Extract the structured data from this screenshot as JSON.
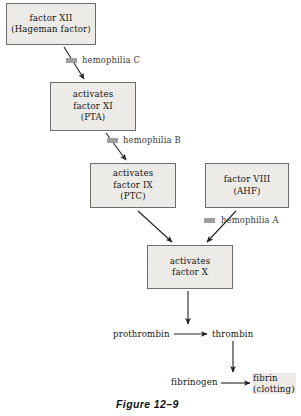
{
  "figure": {
    "caption": "Figure 12–9",
    "topic": "blood coagulation cascade"
  },
  "boxes": [
    {
      "id": "factor-xii",
      "lines": [
        "factor XII",
        "(Hageman factor)"
      ],
      "x": 6,
      "y": 3,
      "w": 90,
      "h": 42
    },
    {
      "id": "factor-xi",
      "lines": [
        "activates",
        "factor XI",
        "(PTA)"
      ],
      "x": 50,
      "y": 82,
      "w": 86,
      "h": 49
    },
    {
      "id": "factor-ix",
      "lines": [
        "activates",
        "factor IX",
        "(PTC)"
      ],
      "x": 90,
      "y": 163,
      "w": 86,
      "h": 45
    },
    {
      "id": "factor-viii",
      "lines": [
        "factor VIII",
        "(AHF)"
      ],
      "x": 205,
      "y": 163,
      "w": 84,
      "h": 45
    },
    {
      "id": "factor-x",
      "lines": [
        "activates",
        "factor X"
      ],
      "x": 147,
      "y": 245,
      "w": 86,
      "h": 44
    }
  ],
  "hemophilia_markers": [
    {
      "id": "hemophilia-c",
      "label": "hemophilia C",
      "mark_x": 66,
      "mark_y": 58,
      "label_x": 82,
      "label_y": 55
    },
    {
      "id": "hemophilia-b",
      "label": "hemophilia B",
      "mark_x": 107,
      "mark_y": 138,
      "label_x": 123,
      "label_y": 135
    },
    {
      "id": "hemophilia-a",
      "label": "hemophilia A",
      "mark_x": 204,
      "mark_y": 218,
      "label_x": 221,
      "label_y": 215
    }
  ],
  "terms": [
    {
      "id": "prothrombin",
      "label": "prothrombin",
      "x": 113,
      "y": 329,
      "shaded": false
    },
    {
      "id": "thrombin",
      "label": "thrombin",
      "x": 212,
      "y": 329,
      "shaded": false
    },
    {
      "id": "fibrinogen",
      "label": "fibrinogen",
      "x": 171,
      "y": 377,
      "shaded": false
    }
  ],
  "fibrin": {
    "id": "fibrin",
    "lines": [
      "fibrin",
      "(clotting)"
    ],
    "x": 252,
    "y": 373
  },
  "colors": {
    "box_fill": "#ecebe7",
    "box_border": "#6d6d6d",
    "marker_gray": "#9f9f9f",
    "text": "#141414",
    "arrow": "#222222",
    "background": "#ffffff"
  },
  "arrows": [
    {
      "id": "arrow-xii-to-xi",
      "type": "diagonal",
      "from": [
        64,
        47
      ],
      "to": [
        84,
        79
      ]
    },
    {
      "id": "arrow-xi-to-ix",
      "type": "diagonal",
      "from": [
        106,
        133
      ],
      "to": [
        126,
        160
      ]
    },
    {
      "id": "arrow-ix-to-x",
      "type": "diagonal",
      "from": [
        138,
        211
      ],
      "to": [
        172,
        242
      ]
    },
    {
      "id": "arrow-viii-to-x",
      "type": "diagonal",
      "from": [
        236,
        211
      ],
      "to": [
        207,
        242
      ]
    },
    {
      "id": "arrow-x-to-prothrombin",
      "type": "vertical",
      "from": [
        188,
        291
      ],
      "to": [
        188,
        324
      ]
    },
    {
      "id": "arrow-prothrombin-to-thrombin",
      "type": "horizontal",
      "from": [
        174,
        334
      ],
      "to": [
        207,
        334
      ]
    },
    {
      "id": "arrow-thrombin-down",
      "type": "vertical",
      "from": [
        233,
        341
      ],
      "to": [
        233,
        372
      ]
    },
    {
      "id": "arrow-fibrinogen-to-fibrin",
      "type": "horizontal",
      "from": [
        221,
        383
      ],
      "to": [
        250,
        383
      ]
    }
  ],
  "caption_pos": {
    "x": 116,
    "y": 398
  }
}
